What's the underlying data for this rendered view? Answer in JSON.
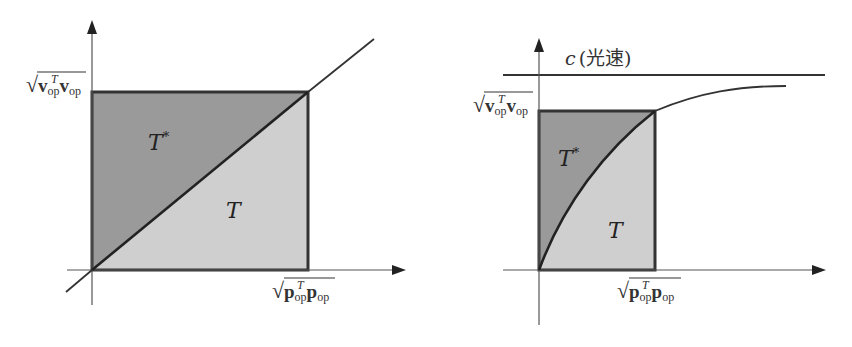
{
  "figure": {
    "colors": {
      "t_star_fill": "#9a9a9a",
      "t_fill": "#cfcfcf",
      "line": "#222222"
    },
    "left_diagram": {
      "y_label": {
        "root": "√",
        "v": "v",
        "sub1": "op",
        "sup": "T",
        "v2": "v",
        "sub2": "op"
      },
      "x_label": {
        "root": "√",
        "p": "p",
        "sub1": "op",
        "sup": "T",
        "p2": "p",
        "sub2": "op"
      },
      "upper_region_label": "T",
      "upper_region_sup": "*",
      "lower_region_label": "T",
      "boundary": "straight diagonal line"
    },
    "right_diagram": {
      "asymptote_label": "c",
      "asymptote_note": "(光速)",
      "y_label": {
        "root": "√",
        "v": "v",
        "sub1": "op",
        "sup": "T",
        "v2": "v",
        "sub2": "op"
      },
      "x_label": {
        "root": "√",
        "p": "p",
        "sub1": "op",
        "sup": "T",
        "p2": "p",
        "sub2": "op"
      },
      "upper_region_label": "T",
      "upper_region_sup": "*",
      "lower_region_label": "T",
      "boundary": "concave curve approaching c"
    }
  }
}
